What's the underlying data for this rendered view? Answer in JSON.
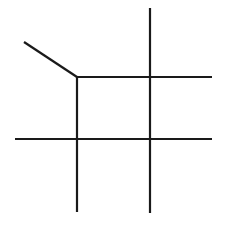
{
  "figure": {
    "background_color": "#ffffff",
    "line_color": "#1a1a1a",
    "canvas": {
      "width": 226,
      "height": 227
    }
  },
  "chart_data": {
    "type": "line",
    "subtitle": "",
    "xlabel": "",
    "ylabel": "",
    "xlim": [
      0,
      226
    ],
    "ylim": [
      0,
      227
    ],
    "grid": false,
    "legend": "none",
    "annotations": [],
    "tick_labels": {
      "x": [],
      "y": []
    },
    "series": [
      {
        "name": "diagonal-segment",
        "orientation": "diagonal",
        "stroke": "#1a1a1a",
        "width": 2.2,
        "x": [
          24,
          77
        ],
        "y": [
          42,
          77
        ]
      },
      {
        "name": "upper-horizontal",
        "orientation": "horizontal",
        "stroke": "#1a1a1a",
        "width": 2.2,
        "x": [
          77,
          212
        ],
        "y": [
          77,
          77
        ]
      },
      {
        "name": "lower-horizontal",
        "orientation": "horizontal",
        "stroke": "#1a1a1a",
        "width": 2.2,
        "x": [
          15,
          212
        ],
        "y": [
          139,
          139
        ]
      },
      {
        "name": "left-vertical",
        "orientation": "vertical",
        "stroke": "#1a1a1a",
        "width": 2.2,
        "x": [
          77,
          77
        ],
        "y": [
          77,
          212
        ]
      },
      {
        "name": "right-vertical",
        "orientation": "vertical",
        "stroke": "#1a1a1a",
        "width": 2.2,
        "x": [
          150,
          150
        ],
        "y": [
          8,
          213
        ]
      }
    ],
    "nodes": [
      {
        "name": "corner-junction",
        "x": 77,
        "y": 77,
        "degree": 3
      },
      {
        "name": "upper-right-crossing",
        "x": 150,
        "y": 77,
        "degree": 4
      },
      {
        "name": "lower-left-crossing",
        "x": 77,
        "y": 139,
        "degree": 4
      },
      {
        "name": "lower-right-crossing",
        "x": 150,
        "y": 139,
        "degree": 4
      }
    ]
  }
}
